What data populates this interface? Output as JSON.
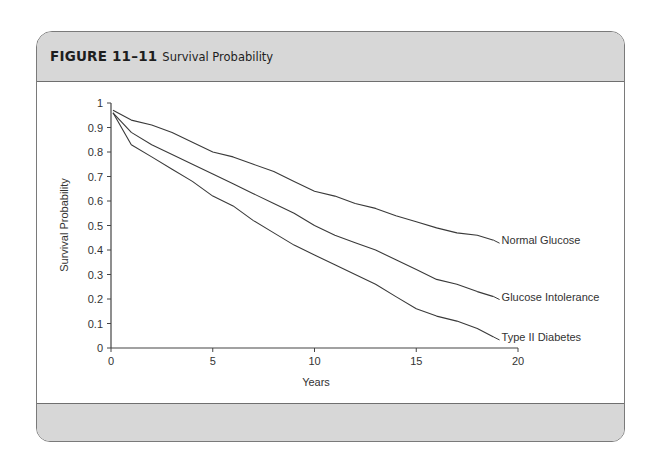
{
  "figure": {
    "number": "FIGURE 11–11",
    "title": "Survival Probability"
  },
  "chart_data": {
    "type": "line",
    "title": "Survival Probability",
    "xlabel": "Years",
    "ylabel": "Survival Probability",
    "xlim": [
      0,
      20
    ],
    "ylim": [
      0,
      1
    ],
    "xticks": [
      0,
      5,
      10,
      15,
      20
    ],
    "yticks": [
      0,
      0.1,
      0.2,
      0.3,
      0.4,
      0.5,
      0.6,
      0.7,
      0.8,
      0.9,
      1
    ],
    "ytick_labels": [
      "0",
      "0.1",
      "0.2",
      "0.3",
      "0.4",
      "0.5",
      "0.6",
      "0.7",
      "0.8",
      "0.9",
      "1"
    ],
    "grid": false,
    "legend": "inline labels at line ends",
    "x": [
      0.1,
      1,
      2,
      3,
      4,
      5,
      6,
      7,
      8,
      9,
      10,
      11,
      12,
      13,
      14,
      15,
      16,
      17,
      18,
      18.8
    ],
    "series": [
      {
        "name": "Normal Glucose",
        "values": [
          0.97,
          0.93,
          0.91,
          0.88,
          0.84,
          0.8,
          0.78,
          0.75,
          0.72,
          0.68,
          0.64,
          0.62,
          0.59,
          0.57,
          0.54,
          0.515,
          0.49,
          0.47,
          0.46,
          0.44
        ]
      },
      {
        "name": "Glucose Intolerance",
        "values": [
          0.96,
          0.88,
          0.83,
          0.79,
          0.75,
          0.71,
          0.67,
          0.63,
          0.59,
          0.55,
          0.5,
          0.46,
          0.43,
          0.4,
          0.36,
          0.32,
          0.28,
          0.26,
          0.23,
          0.21
        ]
      },
      {
        "name": "Type II Diabetes",
        "values": [
          0.96,
          0.83,
          0.78,
          0.73,
          0.68,
          0.62,
          0.58,
          0.52,
          0.47,
          0.42,
          0.38,
          0.34,
          0.3,
          0.26,
          0.21,
          0.16,
          0.13,
          0.11,
          0.08,
          0.045
        ]
      }
    ]
  }
}
